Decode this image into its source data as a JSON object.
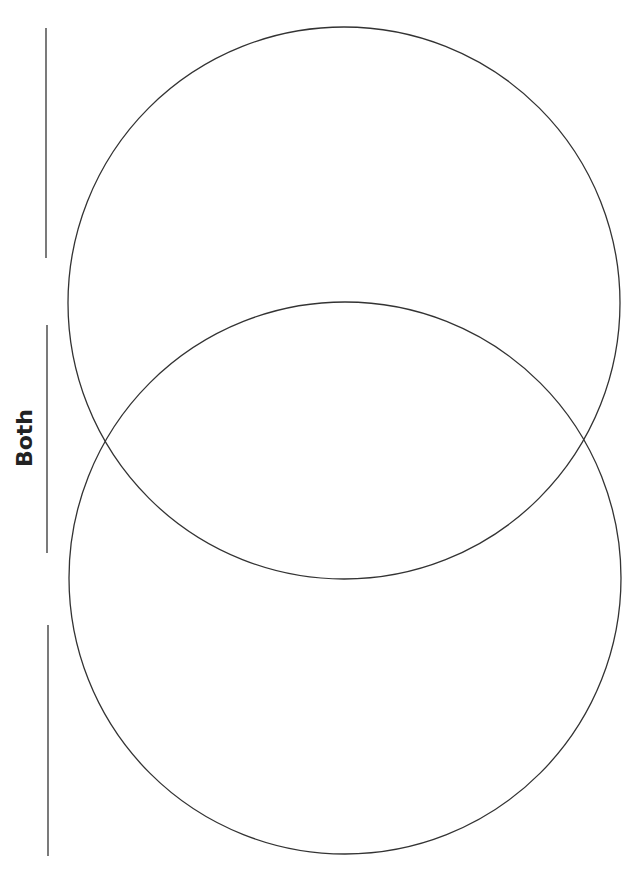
{
  "diagram": {
    "type": "venn",
    "orientation": "vertical-stacked",
    "labels": {
      "overlap": "Both"
    },
    "stroke_color": "#333333",
    "circles": [
      {
        "name": "top",
        "cx": 344,
        "cy": 303,
        "r": 276
      },
      {
        "name": "bottom",
        "cx": 345,
        "cy": 578,
        "r": 276
      }
    ],
    "write_lines": [
      {
        "name": "top",
        "x": 46,
        "y1": 28,
        "y2": 258
      },
      {
        "name": "middle",
        "x": 47,
        "y1": 325,
        "y2": 553
      },
      {
        "name": "bottom",
        "x": 48,
        "y1": 625,
        "y2": 856
      }
    ]
  }
}
